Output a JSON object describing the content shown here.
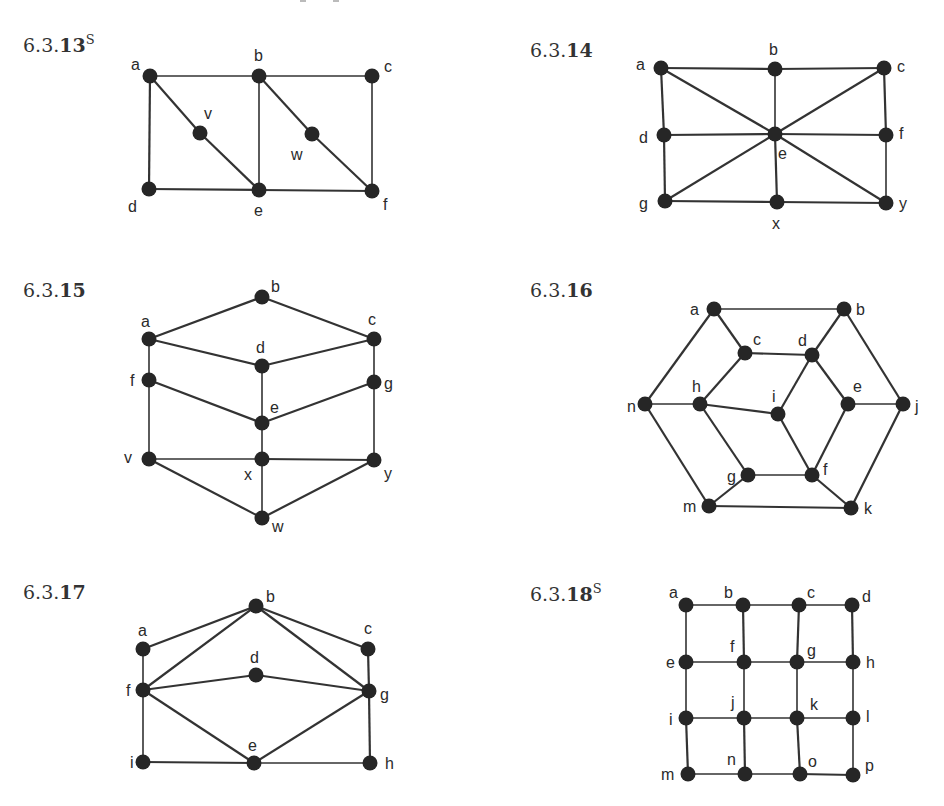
{
  "page": {
    "top_clipped_text_fragment": true
  },
  "figures": [
    {
      "id": "6.3.13",
      "label_prefix": "6.3.",
      "label_num": "13",
      "label_sup": "S",
      "label_pos": [
        23,
        52
      ],
      "vertices": [
        {
          "name": "a",
          "x": 150,
          "y": 76,
          "lx": 131,
          "ly": 70
        },
        {
          "name": "b",
          "x": 259,
          "y": 76,
          "lx": 254,
          "ly": 61
        },
        {
          "name": "c",
          "x": 372,
          "y": 76,
          "lx": 384,
          "ly": 72
        },
        {
          "name": "v",
          "x": 200,
          "y": 133,
          "lx": 204,
          "ly": 119
        },
        {
          "name": "w",
          "x": 312,
          "y": 134,
          "lx": 291,
          "ly": 160
        },
        {
          "name": "d",
          "x": 149,
          "y": 189,
          "lx": 128,
          "ly": 212
        },
        {
          "name": "e",
          "x": 259,
          "y": 190,
          "lx": 254,
          "ly": 216
        },
        {
          "name": "f",
          "x": 372,
          "y": 191,
          "lx": 383,
          "ly": 210
        }
      ],
      "edges": [
        [
          "a",
          "b"
        ],
        [
          "b",
          "c"
        ],
        [
          "a",
          "d"
        ],
        [
          "c",
          "f"
        ],
        [
          "d",
          "e"
        ],
        [
          "e",
          "f"
        ],
        [
          "b",
          "e"
        ],
        [
          "a",
          "v"
        ],
        [
          "v",
          "e"
        ],
        [
          "b",
          "w"
        ],
        [
          "w",
          "f"
        ]
      ]
    },
    {
      "id": "6.3.14",
      "label_prefix": "6.3.",
      "label_num": "14",
      "label_sup": "",
      "label_pos": [
        530,
        57
      ],
      "vertices": [
        {
          "name": "a",
          "x": 661,
          "y": 68,
          "lx": 636,
          "ly": 70
        },
        {
          "name": "b",
          "x": 775,
          "y": 69,
          "lx": 769,
          "ly": 55
        },
        {
          "name": "c",
          "x": 884,
          "y": 68,
          "lx": 897,
          "ly": 72
        },
        {
          "name": "d",
          "x": 664,
          "y": 135,
          "lx": 639,
          "ly": 143
        },
        {
          "name": "e",
          "x": 775,
          "y": 134,
          "lx": 778,
          "ly": 159
        },
        {
          "name": "f",
          "x": 886,
          "y": 135,
          "lx": 899,
          "ly": 139
        },
        {
          "name": "g",
          "x": 665,
          "y": 201,
          "lx": 639,
          "ly": 209
        },
        {
          "name": "x",
          "x": 777,
          "y": 202,
          "lx": 772,
          "ly": 229
        },
        {
          "name": "y",
          "x": 886,
          "y": 203,
          "lx": 899,
          "ly": 209
        }
      ],
      "edges": [
        [
          "a",
          "b"
        ],
        [
          "b",
          "c"
        ],
        [
          "a",
          "d"
        ],
        [
          "d",
          "g"
        ],
        [
          "c",
          "f"
        ],
        [
          "f",
          "y"
        ],
        [
          "g",
          "x"
        ],
        [
          "x",
          "y"
        ],
        [
          "d",
          "e"
        ],
        [
          "e",
          "f"
        ],
        [
          "b",
          "e"
        ],
        [
          "e",
          "x"
        ],
        [
          "a",
          "e"
        ],
        [
          "e",
          "y"
        ],
        [
          "c",
          "e"
        ],
        [
          "e",
          "g"
        ]
      ]
    },
    {
      "id": "6.3.15",
      "label_prefix": "6.3.",
      "label_num": "15",
      "label_sup": "",
      "label_pos": [
        23,
        297
      ],
      "vertices": [
        {
          "name": "b",
          "x": 262,
          "y": 297,
          "lx": 271,
          "ly": 292
        },
        {
          "name": "a",
          "x": 149,
          "y": 339,
          "lx": 141,
          "ly": 327
        },
        {
          "name": "c",
          "x": 374,
          "y": 339,
          "lx": 368,
          "ly": 325
        },
        {
          "name": "d",
          "x": 262,
          "y": 366,
          "lx": 256,
          "ly": 353
        },
        {
          "name": "f",
          "x": 149,
          "y": 380,
          "lx": 130,
          "ly": 386
        },
        {
          "name": "g",
          "x": 374,
          "y": 382,
          "lx": 384,
          "ly": 389
        },
        {
          "name": "e",
          "x": 262,
          "y": 423,
          "lx": 270,
          "ly": 413
        },
        {
          "name": "v",
          "x": 149,
          "y": 459,
          "lx": 124,
          "ly": 463
        },
        {
          "name": "x",
          "x": 262,
          "y": 459,
          "lx": 244,
          "ly": 480
        },
        {
          "name": "y",
          "x": 374,
          "y": 460,
          "lx": 384,
          "ly": 479
        },
        {
          "name": "w",
          "x": 262,
          "y": 518,
          "lx": 272,
          "ly": 532
        }
      ],
      "edges": [
        [
          "a",
          "b"
        ],
        [
          "b",
          "c"
        ],
        [
          "a",
          "d"
        ],
        [
          "d",
          "c"
        ],
        [
          "a",
          "f"
        ],
        [
          "c",
          "g"
        ],
        [
          "d",
          "e"
        ],
        [
          "f",
          "e"
        ],
        [
          "e",
          "g"
        ],
        [
          "f",
          "v"
        ],
        [
          "g",
          "y"
        ],
        [
          "e",
          "x"
        ],
        [
          "v",
          "x"
        ],
        [
          "x",
          "y"
        ],
        [
          "v",
          "w"
        ],
        [
          "x",
          "w"
        ],
        [
          "y",
          "w"
        ]
      ]
    },
    {
      "id": "6.3.16",
      "label_prefix": "6.3.",
      "label_num": "16",
      "label_sup": "",
      "label_pos": [
        530,
        297
      ],
      "vertices": [
        {
          "name": "a",
          "x": 714,
          "y": 309,
          "lx": 690,
          "ly": 315
        },
        {
          "name": "b",
          "x": 844,
          "y": 309,
          "lx": 856,
          "ly": 315
        },
        {
          "name": "c",
          "x": 745,
          "y": 353,
          "lx": 753,
          "ly": 345
        },
        {
          "name": "d",
          "x": 812,
          "y": 355,
          "lx": 798,
          "ly": 346
        },
        {
          "name": "h",
          "x": 700,
          "y": 404,
          "lx": 692,
          "ly": 392
        },
        {
          "name": "n",
          "x": 645,
          "y": 404,
          "lx": 627,
          "ly": 412
        },
        {
          "name": "i",
          "x": 778,
          "y": 414,
          "lx": 772,
          "ly": 402
        },
        {
          "name": "e",
          "x": 848,
          "y": 404,
          "lx": 853,
          "ly": 392
        },
        {
          "name": "j",
          "x": 903,
          "y": 404,
          "lx": 915,
          "ly": 412
        },
        {
          "name": "g",
          "x": 748,
          "y": 475,
          "lx": 727,
          "ly": 482
        },
        {
          "name": "f",
          "x": 812,
          "y": 475,
          "lx": 823,
          "ly": 475
        },
        {
          "name": "m",
          "x": 709,
          "y": 506,
          "lx": 683,
          "ly": 512
        },
        {
          "name": "k",
          "x": 851,
          "y": 508,
          "lx": 864,
          "ly": 514
        }
      ],
      "edges": [
        [
          "a",
          "b"
        ],
        [
          "a",
          "n"
        ],
        [
          "a",
          "c"
        ],
        [
          "b",
          "d"
        ],
        [
          "b",
          "j"
        ],
        [
          "c",
          "d"
        ],
        [
          "c",
          "h"
        ],
        [
          "n",
          "h"
        ],
        [
          "h",
          "i"
        ],
        [
          "h",
          "g"
        ],
        [
          "d",
          "i"
        ],
        [
          "d",
          "e"
        ],
        [
          "e",
          "j"
        ],
        [
          "e",
          "f"
        ],
        [
          "i",
          "f"
        ],
        [
          "g",
          "f"
        ],
        [
          "n",
          "m"
        ],
        [
          "m",
          "g"
        ],
        [
          "m",
          "k"
        ],
        [
          "f",
          "k"
        ],
        [
          "j",
          "k"
        ]
      ]
    },
    {
      "id": "6.3.17",
      "label_prefix": "6.3.",
      "label_num": "17",
      "label_sup": "",
      "label_pos": [
        23,
        599
      ],
      "vertices": [
        {
          "name": "b",
          "x": 256,
          "y": 606,
          "lx": 266,
          "ly": 602
        },
        {
          "name": "a",
          "x": 143,
          "y": 649,
          "lx": 138,
          "ly": 636
        },
        {
          "name": "c",
          "x": 368,
          "y": 649,
          "lx": 364,
          "ly": 634
        },
        {
          "name": "d",
          "x": 256,
          "y": 675,
          "lx": 250,
          "ly": 663
        },
        {
          "name": "f",
          "x": 143,
          "y": 690,
          "lx": 126,
          "ly": 696
        },
        {
          "name": "g",
          "x": 369,
          "y": 691,
          "lx": 380,
          "ly": 700
        },
        {
          "name": "e",
          "x": 254,
          "y": 763,
          "lx": 248,
          "ly": 751
        },
        {
          "name": "i",
          "x": 143,
          "y": 762,
          "lx": 130,
          "ly": 768
        },
        {
          "name": "h",
          "x": 370,
          "y": 763,
          "lx": 385,
          "ly": 769
        }
      ],
      "edges": [
        [
          "a",
          "b"
        ],
        [
          "b",
          "c"
        ],
        [
          "b",
          "f"
        ],
        [
          "b",
          "g"
        ],
        [
          "a",
          "f"
        ],
        [
          "c",
          "g"
        ],
        [
          "f",
          "d"
        ],
        [
          "d",
          "g"
        ],
        [
          "f",
          "e"
        ],
        [
          "e",
          "g"
        ],
        [
          "f",
          "i"
        ],
        [
          "g",
          "h"
        ],
        [
          "i",
          "e"
        ],
        [
          "e",
          "h"
        ]
      ]
    },
    {
      "id": "6.3.18",
      "label_prefix": "6.3.",
      "label_num": "18",
      "label_sup": "S",
      "label_pos": [
        530,
        601
      ],
      "vertices": [
        {
          "name": "a",
          "x": 686,
          "y": 605,
          "lx": 669,
          "ly": 598
        },
        {
          "name": "b",
          "x": 743,
          "y": 605,
          "lx": 724,
          "ly": 598
        },
        {
          "name": "c",
          "x": 799,
          "y": 605,
          "lx": 807,
          "ly": 598
        },
        {
          "name": "d",
          "x": 852,
          "y": 605,
          "lx": 862,
          "ly": 602
        },
        {
          "name": "e",
          "x": 686,
          "y": 662,
          "lx": 666,
          "ly": 668
        },
        {
          "name": "f",
          "x": 744,
          "y": 662,
          "lx": 730,
          "ly": 652
        },
        {
          "name": "g",
          "x": 797,
          "y": 662,
          "lx": 807,
          "ly": 656
        },
        {
          "name": "h",
          "x": 853,
          "y": 662,
          "lx": 866,
          "ly": 668
        },
        {
          "name": "i",
          "x": 686,
          "y": 718,
          "lx": 669,
          "ly": 725
        },
        {
          "name": "j",
          "x": 744,
          "y": 718,
          "lx": 731,
          "ly": 708
        },
        {
          "name": "k",
          "x": 797,
          "y": 718,
          "lx": 810,
          "ly": 710
        },
        {
          "name": "l",
          "x": 853,
          "y": 718,
          "lx": 866,
          "ly": 722
        },
        {
          "name": "m",
          "x": 688,
          "y": 774,
          "lx": 661,
          "ly": 780
        },
        {
          "name": "n",
          "x": 745,
          "y": 774,
          "lx": 727,
          "ly": 765
        },
        {
          "name": "o",
          "x": 800,
          "y": 774,
          "lx": 808,
          "ly": 767
        },
        {
          "name": "p",
          "x": 853,
          "y": 775,
          "lx": 865,
          "ly": 771
        }
      ],
      "edges": [
        [
          "a",
          "b"
        ],
        [
          "b",
          "c"
        ],
        [
          "c",
          "d"
        ],
        [
          "e",
          "f"
        ],
        [
          "f",
          "g"
        ],
        [
          "g",
          "h"
        ],
        [
          "i",
          "j"
        ],
        [
          "j",
          "k"
        ],
        [
          "k",
          "l"
        ],
        [
          "m",
          "n"
        ],
        [
          "n",
          "o"
        ],
        [
          "o",
          "p"
        ],
        [
          "a",
          "e"
        ],
        [
          "e",
          "i"
        ],
        [
          "i",
          "m"
        ],
        [
          "b",
          "f"
        ],
        [
          "f",
          "j"
        ],
        [
          "j",
          "n"
        ],
        [
          "c",
          "g"
        ],
        [
          "g",
          "k"
        ],
        [
          "k",
          "o"
        ],
        [
          "d",
          "h"
        ],
        [
          "h",
          "l"
        ],
        [
          "l",
          "p"
        ]
      ]
    }
  ]
}
